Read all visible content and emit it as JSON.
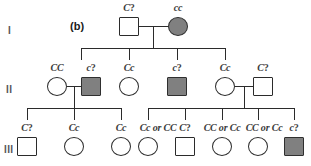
{
  "figure": {
    "panel_label": "(b)",
    "affected_fill_color": "#808080",
    "unaffected_fill_color": "#ffffff",
    "line_color": "#2b2b2b"
  },
  "generation_labels": [
    {
      "numeral": "I"
    },
    {
      "numeral": "II"
    },
    {
      "numeral": "III"
    }
  ],
  "generations": [
    {
      "numeral": "I",
      "individuals": [
        {
          "shape": "square",
          "sex": "male",
          "affected": false,
          "genotype": "C?"
        },
        {
          "shape": "circle",
          "sex": "female",
          "affected": true,
          "genotype": "cc"
        }
      ]
    },
    {
      "numeral": "II",
      "individuals": [
        {
          "shape": "circle",
          "sex": "female",
          "affected": false,
          "genotype": "CC"
        },
        {
          "shape": "square",
          "sex": "male",
          "affected": true,
          "genotype": "c?"
        },
        {
          "shape": "circle",
          "sex": "female",
          "affected": false,
          "genotype": "Cc"
        },
        {
          "shape": "square",
          "sex": "male",
          "affected": true,
          "genotype": "c?"
        },
        {
          "shape": "circle",
          "sex": "female",
          "affected": false,
          "genotype": "Cc"
        },
        {
          "shape": "square",
          "sex": "male",
          "affected": false,
          "genotype": "C?"
        }
      ]
    },
    {
      "numeral": "III",
      "individuals": [
        {
          "shape": "square",
          "sex": "male",
          "affected": false,
          "genotype": "C?"
        },
        {
          "shape": "circle",
          "sex": "female",
          "affected": false,
          "genotype": "Cc"
        },
        {
          "shape": "circle",
          "sex": "female",
          "affected": false,
          "genotype": "Cc"
        },
        {
          "shape": "circle",
          "sex": "female",
          "affected": false,
          "genotype": "Cc or CC"
        },
        {
          "shape": "square",
          "sex": "male",
          "affected": false,
          "genotype": "C?"
        },
        {
          "shape": "circle",
          "sex": "female",
          "affected": false,
          "genotype": "CC or Cc"
        },
        {
          "shape": "circle",
          "sex": "female",
          "affected": false,
          "genotype": "CC or Cc"
        },
        {
          "shape": "square",
          "sex": "male",
          "affected": true,
          "genotype": "c?"
        }
      ]
    }
  ]
}
